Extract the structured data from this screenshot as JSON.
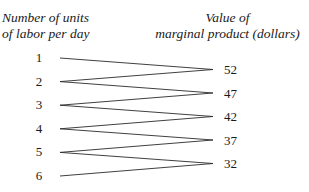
{
  "headers": {
    "left_line1": "Number of units",
    "left_line2": "of labor per day",
    "right_line1": "Value of",
    "right_line2": "marginal product (dollars)"
  },
  "labor_units": [
    "1",
    "2",
    "3",
    "4",
    "5",
    "6"
  ],
  "marginal_values": [
    "52",
    "47",
    "42",
    "37",
    "32"
  ],
  "connections": [
    [
      0,
      0
    ],
    [
      1,
      0
    ],
    [
      1,
      1
    ],
    [
      2,
      1
    ],
    [
      2,
      2
    ],
    [
      3,
      2
    ],
    [
      3,
      3
    ],
    [
      4,
      3
    ],
    [
      4,
      4
    ],
    [
      5,
      4
    ]
  ]
}
